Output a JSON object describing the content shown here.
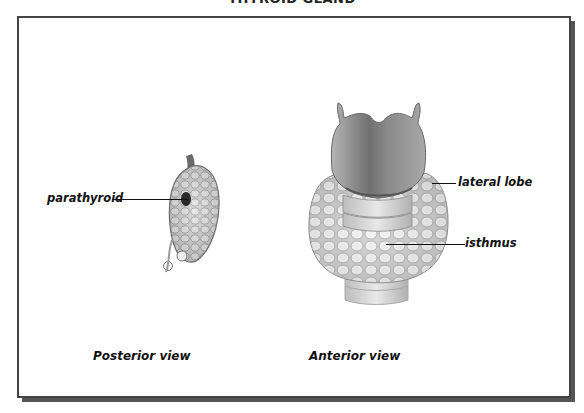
{
  "figure": {
    "title": "THYROID GLAND",
    "views": [
      {
        "name": "posterior",
        "caption": "Posterior view",
        "labels": [
          {
            "text": "parathyroid"
          }
        ]
      },
      {
        "name": "anterior",
        "caption": "Anterior view",
        "labels": [
          {
            "text": "lateral lobe"
          },
          {
            "text": "isthmus"
          }
        ]
      }
    ],
    "colors": {
      "frame": "#444444",
      "shadow": "#555555",
      "tissue_light": "#e8e8e8",
      "tissue_dark": "#7a7a7a",
      "cartilage": "#8f8f8f",
      "text": "#111111"
    }
  }
}
